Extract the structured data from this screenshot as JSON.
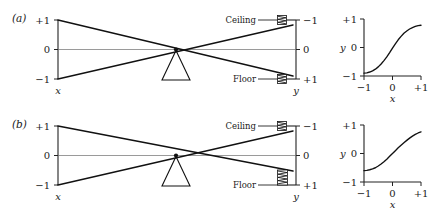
{
  "figure": {
    "background_color": "#ffffff",
    "ink_color": "#111111",
    "thin_line_color": "#6e6e6e"
  },
  "panels": [
    {
      "tag": "(a)",
      "lever": {
        "left_axis": {
          "var_label": "x",
          "ticks": [
            {
              "label": "+1",
              "value": 1
            },
            {
              "label": "0",
              "value": 0
            },
            {
              "label": "−1",
              "value": -1
            }
          ]
        },
        "right_axis": {
          "var_label": "y",
          "ticks": [
            {
              "label": "−1",
              "value": -1
            },
            {
              "label": "0",
              "value": 0
            },
            {
              "label": "+1",
              "value": 1
            }
          ]
        },
        "ceiling_label": "Ceiling",
        "floor_label": "Floor",
        "ceiling_spring_compression": "light",
        "floor_spring_compression": "light"
      },
      "plot": {
        "ylabel": "y",
        "xlabel": "x",
        "ytick_labels": [
          "+1",
          "0",
          "−1"
        ],
        "xtick_labels": [
          "−1",
          "0",
          "+1"
        ]
      },
      "chart": {
        "type": "line",
        "title": "",
        "xlabel": "x",
        "ylabel": "y",
        "xlim": [
          -1,
          1
        ],
        "ylim": [
          -1,
          1
        ],
        "xticks": [
          -1,
          0,
          1
        ],
        "yticks": [
          -1,
          0,
          1
        ],
        "xtick_labels": [
          "−1",
          "0",
          "+1"
        ],
        "ytick_labels": [
          "−1",
          "0",
          "+1"
        ],
        "grid": false,
        "legend": "none",
        "series": [
          {
            "name": "transfer-a",
            "x": [
              -1.0,
              -0.9,
              -0.8,
              -0.7,
              -0.6,
              -0.5,
              -0.4,
              -0.3,
              -0.2,
              -0.1,
              0.0,
              0.1,
              0.2,
              0.3,
              0.4,
              0.5,
              0.6,
              0.7,
              0.8,
              0.9,
              1.0
            ],
            "y": [
              -0.9,
              -0.89,
              -0.86,
              -0.82,
              -0.76,
              -0.68,
              -0.58,
              -0.46,
              -0.33,
              -0.18,
              -0.02,
              0.13,
              0.27,
              0.39,
              0.5,
              0.58,
              0.65,
              0.7,
              0.74,
              0.77,
              0.78
            ]
          }
        ]
      }
    },
    {
      "tag": "(b)",
      "lever": {
        "left_axis": {
          "var_label": "x",
          "ticks": [
            {
              "label": "+1",
              "value": 1
            },
            {
              "label": "0",
              "value": 0
            },
            {
              "label": "−1",
              "value": -1
            }
          ]
        },
        "right_axis": {
          "var_label": "y",
          "ticks": [
            {
              "label": "−1",
              "value": -1
            },
            {
              "label": "0",
              "value": 0
            },
            {
              "label": "+1",
              "value": 1
            }
          ]
        },
        "ceiling_label": "Ceiling",
        "floor_label": "Floor",
        "ceiling_spring_compression": "light",
        "floor_spring_compression": "heavy"
      },
      "plot": {
        "ylabel": "y",
        "xlabel": "x",
        "ytick_labels": [
          "+1",
          "0",
          "−1"
        ],
        "xtick_labels": [
          "−1",
          "0",
          "+1"
        ]
      },
      "chart": {
        "type": "line",
        "title": "",
        "xlabel": "x",
        "ylabel": "y",
        "xlim": [
          -1,
          1
        ],
        "ylim": [
          -1,
          1
        ],
        "xticks": [
          -1,
          0,
          1
        ],
        "yticks": [
          -1,
          0,
          1
        ],
        "xtick_labels": [
          "−1",
          "0",
          "+1"
        ],
        "ytick_labels": [
          "−1",
          "0",
          "+1"
        ],
        "grid": false,
        "legend": "none",
        "series": [
          {
            "name": "transfer-b",
            "x": [
              -1.0,
              -0.9,
              -0.8,
              -0.7,
              -0.6,
              -0.5,
              -0.4,
              -0.3,
              -0.2,
              -0.1,
              0.0,
              0.1,
              0.2,
              0.3,
              0.4,
              0.5,
              0.6,
              0.7,
              0.8,
              0.9,
              1.0
            ],
            "y": [
              -0.6,
              -0.59,
              -0.57,
              -0.54,
              -0.5,
              -0.44,
              -0.37,
              -0.29,
              -0.2,
              -0.1,
              0.0,
              0.1,
              0.2,
              0.29,
              0.38,
              0.46,
              0.54,
              0.61,
              0.67,
              0.72,
              0.76
            ]
          }
        ]
      }
    }
  ]
}
